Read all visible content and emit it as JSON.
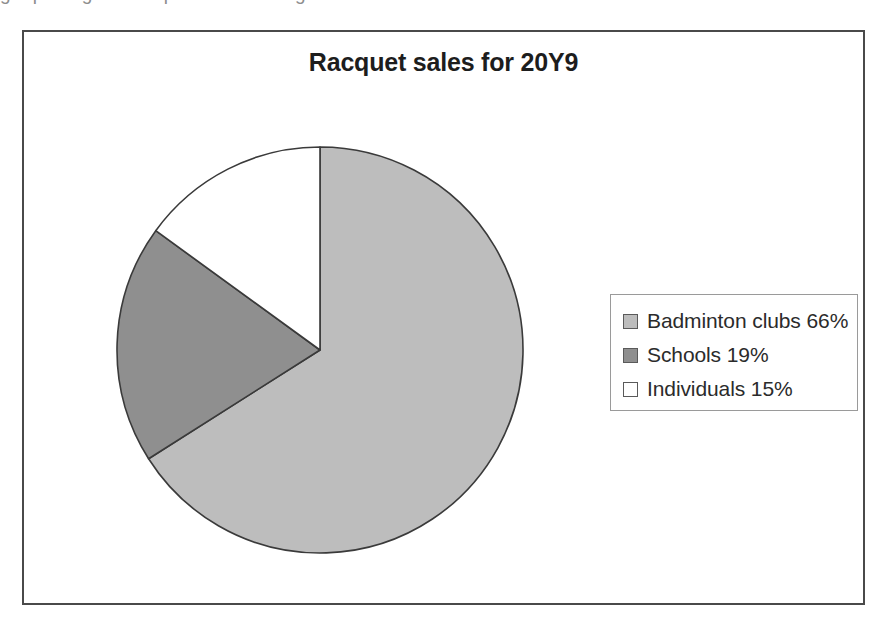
{
  "page": {
    "top_bleed_text": "g    p       g             p                      g"
  },
  "chart": {
    "title": "Racquet sales for 20Y9",
    "frame_border_color": "#4a4a4a",
    "background_color": "#ffffff",
    "slice_outline_color": "#3a3a3a"
  },
  "legend": {
    "border_color": "#9a9a9a",
    "items": [
      {
        "label": "Badminton clubs 66%",
        "color": "#bdbdbd",
        "swatch_name": "legend-swatch-badminton-clubs"
      },
      {
        "label": "Schools 19%",
        "color": "#8f8f8f",
        "swatch_name": "legend-swatch-schools"
      },
      {
        "label": "Individuals 15%",
        "color": "#ffffff",
        "swatch_name": "legend-swatch-individuals"
      }
    ]
  },
  "chart_data": {
    "type": "pie",
    "title": "Racquet sales for 20Y9",
    "xlabel": "",
    "ylabel": "",
    "categories": [
      "Badminton clubs",
      "Schools",
      "Individuals"
    ],
    "values": [
      66,
      19,
      15
    ],
    "value_unit": "%",
    "labels": [
      "Badminton clubs 66%",
      "Schools 19%",
      "Individuals 15%"
    ],
    "colors": [
      "#bdbdbd",
      "#8f8f8f",
      "#ffffff"
    ],
    "start_angle_deg": 0,
    "direction": "clockwise",
    "legend": true,
    "legend_position": "right",
    "grid": false,
    "data_labels_on_slices": false
  }
}
